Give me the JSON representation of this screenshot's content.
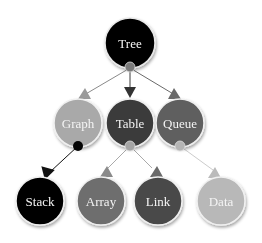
{
  "diagram": {
    "type": "tree",
    "nodes": [
      {
        "id": "tree",
        "label": "Tree",
        "color": "#050505"
      },
      {
        "id": "graph",
        "label": "Graph",
        "color": "#a9a9a9"
      },
      {
        "id": "table",
        "label": "Table",
        "color": "#3b3b3b"
      },
      {
        "id": "queue",
        "label": "Queue",
        "color": "#5e5e5e"
      },
      {
        "id": "stack",
        "label": "Stack",
        "color": "#050505"
      },
      {
        "id": "array",
        "label": "Array",
        "color": "#6e6e6e"
      },
      {
        "id": "link",
        "label": "Link",
        "color": "#4a4a4a"
      },
      {
        "id": "data",
        "label": "Data",
        "color": "#b8b8b8"
      }
    ],
    "edges": [
      {
        "from": "tree",
        "to": "graph"
      },
      {
        "from": "tree",
        "to": "table"
      },
      {
        "from": "tree",
        "to": "queue"
      },
      {
        "from": "graph",
        "to": "stack"
      },
      {
        "from": "table",
        "to": "array"
      },
      {
        "from": "table",
        "to": "link"
      },
      {
        "from": "queue",
        "to": "data"
      }
    ]
  }
}
